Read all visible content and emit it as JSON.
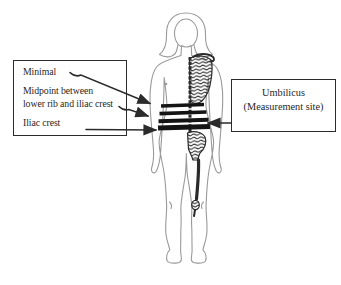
{
  "diagram": {
    "left_box": {
      "minimal_label": "Minimal",
      "midpoint_label_line1": "Midpoint between",
      "midpoint_label_line2": "lower rib and iliac crest",
      "iliac_crest_label": "Iliac crest"
    },
    "right_box": {
      "umbilicus_label": "Umbilicus",
      "measurement_site_label": "(Measurement site)"
    },
    "figure": {
      "alt": "Front view of a human body with half skeleton shown and four horizontal waist-measurement bands at the minimal waist, midpoint between lower rib and iliac crest, umbilicus, and iliac crest"
    },
    "colors": {
      "ink": "#2b2b2b",
      "body_outline": "#9a9a9a",
      "band": "#141414",
      "background": "#ffffff"
    }
  }
}
